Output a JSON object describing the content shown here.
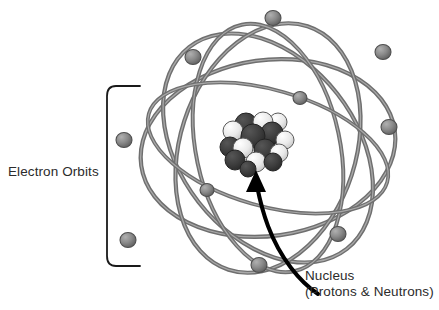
{
  "diagram": {
    "type": "atom-model",
    "background_color": "#ffffff",
    "labels": {
      "electron_orbits": "Electron Orbits",
      "nucleus_line1": "Nucleus",
      "nucleus_line2": "(Protons & Neutrons)"
    },
    "colors": {
      "orbit_stroke": "#6f6f6f",
      "orbit_highlight": "#a8a8a8",
      "electron_fill": "#7d7d7d",
      "electron_stroke": "#4a4a4a",
      "proton_dark": "#3a3a3a",
      "neutron_light": "#ededed",
      "particle_stroke": "#2e2e2e",
      "arrow": "#000000",
      "bracket": "#1a1a1a",
      "text": "#2b2b2b"
    },
    "counts": {
      "orbits": 5,
      "electrons": 9,
      "nucleus_particles": 17
    },
    "orbits": [
      {
        "name": "orbit-1",
        "cx": 268,
        "cy": 148,
        "rx": 128,
        "ry": 88,
        "rotate": -8
      },
      {
        "name": "orbit-2",
        "cx": 268,
        "cy": 148,
        "rx": 128,
        "ry": 88,
        "rotate": 52
      },
      {
        "name": "orbit-3",
        "cx": 268,
        "cy": 148,
        "rx": 128,
        "ry": 88,
        "rotate": 108
      },
      {
        "name": "orbit-4",
        "cx": 268,
        "cy": 148,
        "rx": 126,
        "ry": 72,
        "rotate": 78
      },
      {
        "name": "orbit-5",
        "cx": 268,
        "cy": 148,
        "rx": 124,
        "ry": 60,
        "rotate": 20
      }
    ],
    "electrons": [
      {
        "name": "electron-top",
        "cx": 273,
        "cy": 18,
        "r": 7.5
      },
      {
        "name": "electron-upper-left",
        "cx": 193,
        "cy": 57,
        "r": 7.5
      },
      {
        "name": "electron-upper-right",
        "cx": 383,
        "cy": 52,
        "r": 7.5
      },
      {
        "name": "electron-mid-right",
        "cx": 300,
        "cy": 98,
        "r": 6.5
      },
      {
        "name": "electron-right",
        "cx": 389,
        "cy": 126,
        "r": 7.5
      },
      {
        "name": "electron-left",
        "cx": 124,
        "cy": 140,
        "r": 7.5
      },
      {
        "name": "electron-inner-left",
        "cx": 208,
        "cy": 190,
        "r": 6.5
      },
      {
        "name": "electron-lower-left",
        "cx": 128,
        "cy": 241,
        "r": 7.5
      },
      {
        "name": "electron-lower-right",
        "cx": 338,
        "cy": 234,
        "r": 7.5
      },
      {
        "name": "electron-bottom",
        "cx": 259,
        "cy": 265,
        "r": 7.5
      }
    ],
    "nucleus": {
      "name": "nucleus-cluster",
      "center_x": 253,
      "center_y": 142,
      "particles": [
        {
          "kind": "proton",
          "cx": 246,
          "cy": 124,
          "r": 11
        },
        {
          "kind": "neutron",
          "cx": 263,
          "cy": 122,
          "r": 10
        },
        {
          "kind": "proton",
          "cx": 272,
          "cy": 133,
          "r": 11
        },
        {
          "kind": "neutron",
          "cx": 233,
          "cy": 131,
          "r": 10
        },
        {
          "kind": "proton",
          "cx": 253,
          "cy": 136,
          "r": 12
        },
        {
          "kind": "neutron",
          "cx": 278,
          "cy": 122,
          "r": 9
        },
        {
          "kind": "proton",
          "cx": 230,
          "cy": 147,
          "r": 10
        },
        {
          "kind": "neutron",
          "cx": 243,
          "cy": 148,
          "r": 10
        },
        {
          "kind": "proton",
          "cx": 265,
          "cy": 150,
          "r": 11
        },
        {
          "kind": "neutron",
          "cx": 279,
          "cy": 144,
          "r": 9
        },
        {
          "kind": "proton",
          "cx": 238,
          "cy": 160,
          "r": 10
        },
        {
          "kind": "neutron",
          "cx": 256,
          "cy": 162,
          "r": 9
        },
        {
          "kind": "proton",
          "cx": 270,
          "cy": 160,
          "r": 9
        },
        {
          "kind": "proton",
          "cx": 249,
          "cy": 168,
          "r": 8
        }
      ]
    },
    "bracket": {
      "name": "electron-orbits-bracket",
      "x": 107,
      "top": 86,
      "bottom": 266,
      "tip_x": 140
    },
    "arrow": {
      "name": "nucleus-pointer-arrow",
      "from_x": 318,
      "from_y": 292,
      "tip_x": 256,
      "tip_y": 172
    }
  }
}
